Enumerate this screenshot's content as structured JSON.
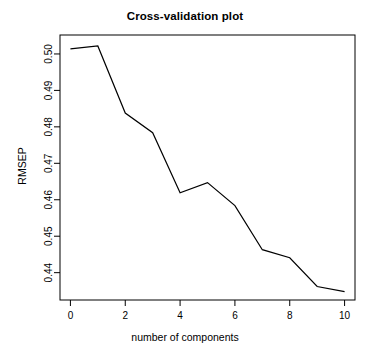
{
  "chart_data": {
    "type": "line",
    "title": "Cross-validation plot",
    "xlabel": "number of components",
    "ylabel": "RMSEP",
    "x": [
      0,
      1,
      2,
      3,
      4,
      5,
      6,
      7,
      8,
      9,
      10
    ],
    "values": [
      0.5014,
      0.5022,
      0.4838,
      0.4784,
      0.4619,
      0.4647,
      0.4584,
      0.4463,
      0.4441,
      0.4362,
      0.4348
    ],
    "xlim": [
      -0.38,
      10.38
    ],
    "ylim": [
      0.4325,
      0.5052
    ],
    "xticks": [
      0,
      2,
      4,
      6,
      8,
      10
    ],
    "xtick_labels": [
      "0",
      "2",
      "4",
      "6",
      "8",
      "10"
    ],
    "yticks": [
      0.44,
      0.45,
      0.46,
      0.47,
      0.48,
      0.49,
      0.5
    ],
    "ytick_labels": [
      "0.44",
      "0.45",
      "0.46",
      "0.47",
      "0.48",
      "0.49",
      "0.50"
    ],
    "grid": false,
    "legend": null,
    "line_color": "#000000",
    "background_color": "#ffffff",
    "box_color": "#000000"
  }
}
